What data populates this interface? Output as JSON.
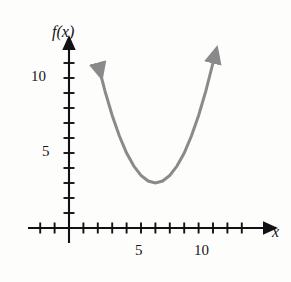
{
  "figure": {
    "background_color": "#fdfdfc",
    "width": 291,
    "height": 282
  },
  "axes": {
    "y_axis_label": "f(x)",
    "x_axis_label": "x",
    "axis_color": "#121215",
    "origin_px": [
      69,
      228
    ],
    "x_px_per_unit": 14.4,
    "y_px_per_unit": 15.0,
    "x_ticks_visible": [
      -2,
      -1,
      0,
      1,
      2,
      3,
      4,
      5,
      6,
      7,
      8,
      9,
      10,
      11,
      12
    ],
    "y_ticks_visible": [
      1,
      2,
      3,
      4,
      5,
      6,
      7,
      8,
      9,
      10,
      11
    ],
    "x_tick_labels": [
      {
        "value": 5,
        "text": "5"
      },
      {
        "value": 10,
        "text": "10"
      }
    ],
    "y_tick_labels": [
      {
        "value": 5,
        "text": "5"
      },
      {
        "value": 10,
        "text": "10"
      }
    ]
  },
  "chart_data": {
    "type": "line",
    "title": "",
    "xlabel": "x",
    "ylabel": "f(x)",
    "xlim": [
      -2.8,
      13.5
    ],
    "ylim": [
      -1.2,
      12.5
    ],
    "grid": false,
    "legend": false,
    "series": [
      {
        "name": "f(x)",
        "color": "#8a8a8a",
        "line_width": 3,
        "shape": "parabola",
        "vertex": [
          6,
          3
        ],
        "equation": "f(x) = 0.5(x - 6)^2 + 3",
        "arrow_start": true,
        "arrow_end": true,
        "x": [
          2.05,
          2.5,
          3.0,
          3.5,
          4.0,
          4.5,
          5.0,
          5.5,
          6.0,
          6.5,
          7.0,
          7.5,
          8.0,
          8.5,
          9.0,
          9.5,
          10.05
        ],
        "values": [
          10.8,
          9.13,
          7.5,
          6.13,
          5.0,
          4.13,
          3.5,
          3.13,
          3.0,
          3.13,
          3.5,
          4.13,
          5.0,
          6.13,
          7.5,
          9.13,
          11.2
        ]
      }
    ]
  }
}
